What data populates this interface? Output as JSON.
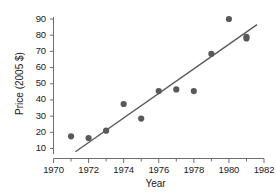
{
  "chart_data": {
    "type": "scatter",
    "title": "",
    "xlabel": "Year",
    "ylabel": "Price (2005 $)",
    "xlim": [
      1970,
      1982
    ],
    "ylim": [
      10,
      90
    ],
    "grid": false,
    "legend": null,
    "xticks": [
      1970,
      1972,
      1974,
      1976,
      1978,
      1980,
      1982
    ],
    "xticklabels": [
      "1970",
      "1972",
      "1974",
      "1976",
      "1978",
      "1980",
      "1982"
    ],
    "xminorticks": [
      1971,
      1973,
      1975,
      1977,
      1979,
      1981
    ],
    "yticks": [
      10,
      20,
      30,
      40,
      50,
      60,
      70,
      80,
      90
    ],
    "yticklabels": [
      "10",
      "20",
      "30",
      "40",
      "50",
      "60",
      "70",
      "80",
      "90"
    ],
    "marker": "filled-circle",
    "marker_color": "#58595b",
    "line_color": "#58595b",
    "points": [
      {
        "x": 1971,
        "y": 17.5
      },
      {
        "x": 1972,
        "y": 16.5
      },
      {
        "x": 1973,
        "y": 21.0
      },
      {
        "x": 1974,
        "y": 37.5
      },
      {
        "x": 1975,
        "y": 28.5
      },
      {
        "x": 1976,
        "y": 45.5
      },
      {
        "x": 1977,
        "y": 46.5
      },
      {
        "x": 1978,
        "y": 45.5
      },
      {
        "x": 1979,
        "y": 68.5
      },
      {
        "x": 1980,
        "y": 90.0
      },
      {
        "x": 1981,
        "y": 79.0
      },
      {
        "x": 1981,
        "y": 78.0
      }
    ],
    "trendline": {
      "name": "least-squares fit",
      "x_start": 1971.25,
      "y_start": 8.0,
      "x_end": 1981.6,
      "y_end": 86.5
    }
  },
  "axis_titles": {
    "x": "Year",
    "y": "Price (2005 $)"
  }
}
